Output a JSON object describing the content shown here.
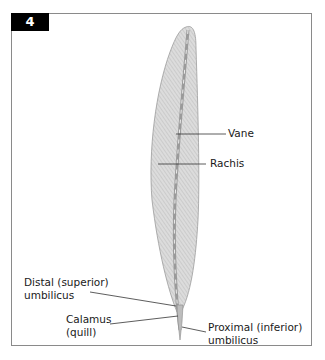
{
  "figure": {
    "number": "4",
    "labels": {
      "vane": "Vane",
      "rachis": "Rachis",
      "distal_umbilicus": [
        "Distal (superior)",
        "umbilicus"
      ],
      "calamus": [
        "Calamus",
        "(quill)"
      ],
      "proximal_umbilicus": [
        "Proximal (inferior)",
        "umbilicus"
      ]
    }
  },
  "colors": {
    "vane_fill": "#d9d9d9",
    "vane_hatch": "#b0b0b0",
    "rachis": "#9a9a9a",
    "frame": "#8a8a8a",
    "badge": "#000000",
    "leader": "#333333"
  }
}
